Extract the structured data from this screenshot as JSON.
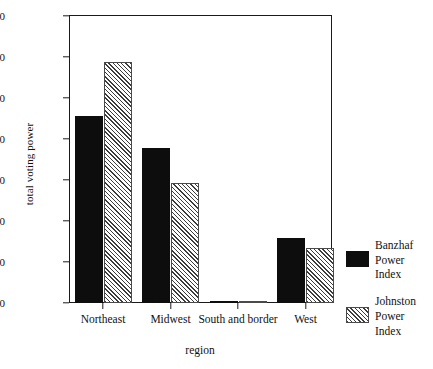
{
  "chart_data": {
    "type": "bar",
    "title": "",
    "xlabel": "region",
    "ylabel": "total voting power",
    "categories": [
      "Northeast",
      "Midwest",
      "South and border",
      "West"
    ],
    "series": [
      {
        "name": "Banzhaf\nPower\nIndex",
        "key": "banzhaf",
        "values": [
          0.455,
          0.378,
          0.002,
          0.159
        ],
        "fill": "solid"
      },
      {
        "name": "Johnston\nPower\nIndex",
        "key": "johnston",
        "values": [
          0.588,
          0.293,
          0.002,
          0.134
        ],
        "fill": "hatch"
      }
    ],
    "ylim": [
      0.0,
      0.7
    ],
    "ytick_labels": [
      ".700",
      ".600",
      ".500",
      ".400",
      ".300",
      ".200",
      ".100",
      ".000"
    ],
    "ytick_values": [
      0.7,
      0.6,
      0.5,
      0.4,
      0.3,
      0.2,
      0.1,
      0.0
    ],
    "grid": false,
    "legend_position": "right",
    "colors": {
      "banzhaf": "#0d0d0d",
      "johnston": "#f2f2f2",
      "axis": "#1a1a1a"
    }
  }
}
